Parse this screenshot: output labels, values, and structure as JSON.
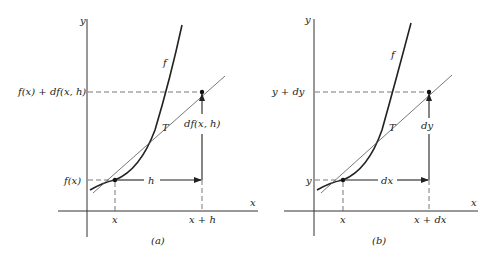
{
  "figure": {
    "panel_a": {
      "caption": "(a)",
      "y_axis_label": "y",
      "x_axis_label": "x",
      "curve_label": "f",
      "tangent_label": "T",
      "y_tick_upper": "f(x) + df(x, h)",
      "y_tick_lower": "f(x)",
      "x_tick_left": "x",
      "x_tick_right": "x + h",
      "horizontal_increment": "h",
      "vertical_increment": "df(x, h)"
    },
    "panel_b": {
      "caption": "(b)",
      "y_axis_label": "y",
      "x_axis_label": "x",
      "curve_label": "f",
      "tangent_label": "T",
      "y_tick_upper": "y + dy",
      "y_tick_lower": "y",
      "x_tick_left": "x",
      "x_tick_right": "x + dx",
      "horizontal_increment": "dx",
      "vertical_increment": "dy"
    }
  }
}
